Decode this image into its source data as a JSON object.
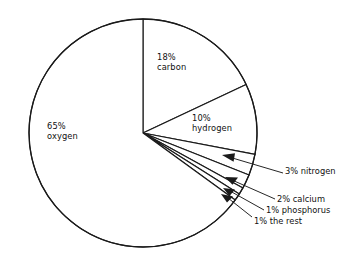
{
  "chart_data": {
    "type": "pie",
    "title": "",
    "subtitle": "",
    "xlabel": "",
    "ylabel": "",
    "legend_position": "none",
    "grid": false,
    "units": "percent",
    "start_angle_deg": 0,
    "direction": "clockwise",
    "categories": [
      "carbon",
      "hydrogen",
      "nitrogen",
      "calcium",
      "phosphorus",
      "the rest",
      "oxygen"
    ],
    "values": [
      18,
      10,
      3,
      2,
      1,
      1,
      65
    ],
    "slices": [
      {
        "id": "carbon",
        "percent": 18,
        "percent_text": "18%",
        "name": "carbon",
        "label_style": "inside",
        "label_line1": "18%",
        "label_line2": "carbon"
      },
      {
        "id": "hydrogen",
        "percent": 10,
        "percent_text": "10%",
        "name": "hydrogen",
        "label_style": "inside",
        "label_line1": "10%",
        "label_line2": "hydrogen"
      },
      {
        "id": "nitrogen",
        "percent": 3,
        "percent_text": "3%",
        "name": "nitrogen",
        "label_style": "callout",
        "callout_text": "3% nitrogen"
      },
      {
        "id": "calcium",
        "percent": 2,
        "percent_text": "2%",
        "name": "calcium",
        "label_style": "callout",
        "callout_text": "2% calcium"
      },
      {
        "id": "phosphorus",
        "percent": 1,
        "percent_text": "1%",
        "name": "phosphorus",
        "label_style": "callout",
        "callout_text": "1% phosphorus"
      },
      {
        "id": "the-rest",
        "percent": 1,
        "percent_text": "1%",
        "name": "the rest",
        "label_style": "callout",
        "callout_text": "1% the rest"
      },
      {
        "id": "oxygen",
        "percent": 65,
        "percent_text": "65%",
        "name": "oxygen",
        "label_style": "inside",
        "label_line1": "65%",
        "label_line2": "oxygen"
      }
    ],
    "colors": {
      "slice_fill": "#ffffff",
      "outline": "#1a1a1a",
      "text": "#111111",
      "background": "#ffffff"
    }
  },
  "labels": {
    "oxygen_pct": "65%",
    "oxygen_name": "oxygen",
    "carbon_pct": "18%",
    "carbon_name": "carbon",
    "hydrogen_pct": "10%",
    "hydrogen_name": "hydrogen",
    "nitrogen_callout": "3% nitrogen",
    "calcium_callout": "2% calcium",
    "phosphorus_callout": "1% phosphorus",
    "rest_callout": "1% the rest"
  }
}
